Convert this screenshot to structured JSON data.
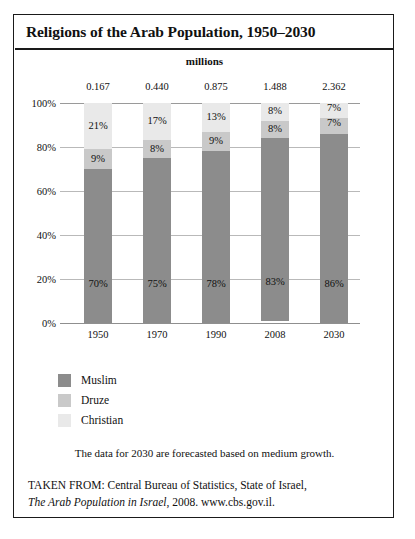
{
  "chart_data": {
    "type": "bar",
    "subtype": "stacked-100-percent",
    "title": "Religions of the Arab Population, 1950–2030",
    "units_caption": "millions",
    "xlabel": "",
    "ylabel": "",
    "categories": [
      "1950",
      "1970",
      "1990",
      "2008",
      "2030"
    ],
    "totals_label": "millions",
    "totals": [
      "0.167",
      "0.440",
      "0.875",
      "1.488",
      "2.362"
    ],
    "totals_numeric": [
      0.167,
      0.44,
      0.875,
      1.488,
      2.362
    ],
    "series": [
      {
        "name": "Muslim",
        "color": "#8c8c8c",
        "values": [
          70,
          75,
          78,
          83,
          86
        ],
        "labels": [
          "70%",
          "75%",
          "78%",
          "83%",
          "86%"
        ]
      },
      {
        "name": "Druze",
        "color": "#c9c9c9",
        "values": [
          9,
          8,
          9,
          8,
          7
        ],
        "labels": [
          "9%",
          "8%",
          "9%",
          "8%",
          "7%"
        ]
      },
      {
        "name": "Christian",
        "color": "#e9e9e9",
        "values": [
          21,
          17,
          13,
          8,
          7
        ],
        "labels": [
          "21%",
          "17%",
          "13%",
          "8%",
          "7%"
        ]
      }
    ],
    "ylim": [
      0,
      100
    ],
    "yticks": [
      "0%",
      "20%",
      "40%",
      "60%",
      "80%",
      "100%"
    ],
    "ytick_values": [
      0,
      20,
      40,
      60,
      80,
      100
    ],
    "grid": true,
    "legend_position": "below-left",
    "annotations": [
      "The data for 2030 are forecasted based on medium growth."
    ]
  },
  "legend": {
    "items": [
      {
        "label": "Muslim",
        "color": "#8c8c8c"
      },
      {
        "label": "Druze",
        "color": "#c9c9c9"
      },
      {
        "label": "Christian",
        "color": "#e9e9e9"
      }
    ]
  },
  "notes": {
    "forecast": "The data for 2030 are forecasted based on medium growth."
  },
  "source": {
    "line1": "TAKEN FROM: Central Bureau of Statistics, State of Israel,",
    "line2_italic": "The Arab Population in Israel",
    "line2_rest": ", 2008. www.cbs.gov.il."
  },
  "colors": {
    "muslim": "#8c8c8c",
    "druze": "#c9c9c9",
    "christian": "#e9e9e9",
    "frame": "#1a1a1a",
    "gridline": "#b9b9b9",
    "text": "#111111"
  }
}
